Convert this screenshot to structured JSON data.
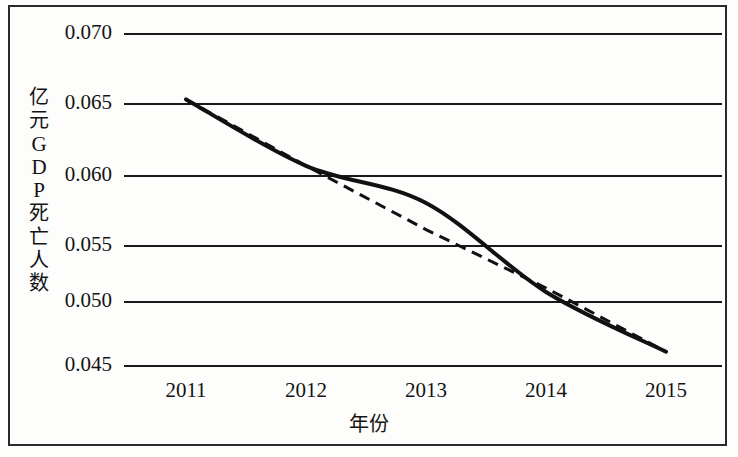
{
  "chart_data": {
    "type": "line",
    "title": "",
    "xlabel": "年份",
    "ylabel": "亿元GDP死亡人数",
    "ylabel_chars": [
      "亿",
      "元",
      "G",
      "D",
      "P",
      "死",
      "亡",
      "人",
      "数"
    ],
    "categories": [
      "2011",
      "2012",
      "2013",
      "2014",
      "2015"
    ],
    "x": [
      2011,
      2012,
      2013,
      2014,
      2015
    ],
    "xlim": [
      2011,
      2015
    ],
    "ylim": [
      0.045,
      0.07
    ],
    "ytick_labels": [
      "0.070",
      "0.065",
      "0.060",
      "0.055",
      "0.050",
      "0.045"
    ],
    "ytick_values": [
      0.07,
      0.065,
      0.06,
      0.055,
      0.05,
      0.045
    ],
    "xtick_labels": [
      "2011",
      "2012",
      "2013",
      "2014",
      "2015"
    ],
    "grid": true,
    "legend": "none",
    "series": [
      {
        "name": "亿元GDP死亡人数",
        "style": "solid",
        "color": "#111111",
        "values": [
          0.065,
          0.06,
          0.0572,
          0.0505,
          0.046
        ]
      },
      {
        "name": "趋势线",
        "style": "dashed",
        "color": "#111111",
        "values": [
          0.065,
          0.06,
          0.0552,
          0.0508,
          0.046
        ]
      }
    ]
  },
  "axes": {
    "y_title": "亿元GDP死亡人数",
    "x_title": "年份"
  }
}
